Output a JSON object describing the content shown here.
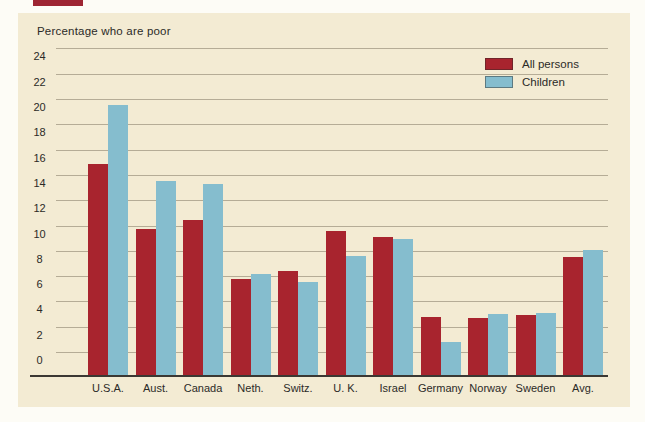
{
  "figure": {
    "title": "Percentage who are poor"
  },
  "colors": {
    "page_background": "#fdfcf6",
    "panel_background": "#f3ebd3",
    "gridline": "#b5ac96",
    "axis_line": "#3b3833",
    "text": "#2b2a27",
    "top_strip": "#9e2533",
    "all_persons_red": "#a8242e",
    "children_blue": "#85bdce"
  },
  "chart_data": {
    "type": "bar",
    "title": "Percentage who are poor",
    "categories": [
      "U.S.A.",
      "Aust.",
      "Canada",
      "Neth.",
      "Switz.",
      "U. K.",
      "Israel",
      "Germany",
      "Norway",
      "Sweden",
      "Avg."
    ],
    "series": [
      {
        "name": "All persons",
        "color": "#a8242e",
        "values": [
          14.9,
          9.7,
          10.4,
          5.8,
          6.4,
          9.6,
          9.1,
          2.8,
          2.7,
          2.9,
          7.5
        ]
      },
      {
        "name": "Children",
        "color": "#85bdce",
        "values": [
          19.5,
          13.5,
          13.3,
          6.2,
          5.5,
          7.6,
          8.9,
          0.8,
          3.0,
          3.1,
          8.1
        ]
      }
    ],
    "xlabel": "",
    "ylabel": "Percentage who are poor",
    "ylim": [
      0,
      24
    ],
    "y_ticks": [
      24,
      22,
      20,
      18,
      16,
      14,
      12,
      10,
      8,
      6,
      4,
      2,
      0
    ],
    "grid": "horizontal",
    "legend_position": "top-right",
    "bar_baseline_below_zero": true
  }
}
